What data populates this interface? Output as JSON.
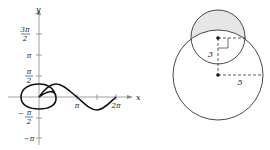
{
  "left_graph": {
    "axis_labels": {
      "x": "x",
      "y": "y"
    },
    "y_ticks": [
      {
        "num": "3π",
        "den": "2",
        "y": 34
      },
      {
        "label": "π",
        "y": 55
      },
      {
        "num": "π",
        "den": "2",
        "y": 76
      },
      {
        "num": "π",
        "den": "2",
        "neg": true,
        "y": 118
      },
      {
        "label": "−π",
        "y": 138
      }
    ],
    "x_ticks": [
      {
        "label": "π"
      },
      {
        "label": "2π"
      }
    ],
    "curve": "polar figure-eight loop curve"
  },
  "right_diagram": {
    "small_circle_label": "3",
    "large_circle_label": "5",
    "shaded_region": "lens top of small circle outside large circle",
    "shade_color": "#e6e6e6"
  }
}
